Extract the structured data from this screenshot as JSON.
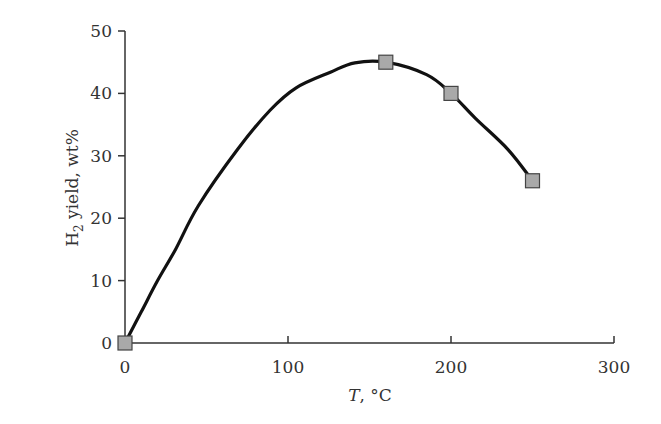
{
  "chart_data": {
    "type": "line",
    "title": "",
    "xlabel": "T, °C",
    "xlabel_italic_part": "T",
    "xlabel_rest": ", °C",
    "ylabel": "H2 yield, wt%",
    "ylabel_main": "H",
    "ylabel_sub": "2",
    "ylabel_rest": " yield, wt%",
    "xlim": [
      0,
      300
    ],
    "ylim": [
      0,
      50
    ],
    "xticks": [
      0,
      100,
      200,
      300
    ],
    "yticks": [
      0,
      10,
      20,
      30,
      40,
      50
    ],
    "grid": false,
    "legend": null,
    "series": [
      {
        "name": "H2 yield (measured)",
        "style": "markers",
        "marker": "square",
        "marker_fill": "#a9a9a9",
        "marker_edge": "#444444",
        "x": [
          0,
          160,
          200,
          250
        ],
        "y": [
          0,
          45,
          40,
          26
        ]
      },
      {
        "name": "H2 yield (fitted curve)",
        "style": "line",
        "color": "#111111",
        "x": [
          0,
          10,
          20,
          31,
          45,
          69,
          89,
          105,
          126,
          141,
          160,
          185,
          200,
          215,
          235,
          250
        ],
        "y": [
          0,
          5,
          10,
          15,
          22,
          31,
          37.3,
          40.9,
          43.4,
          44.9,
          45,
          43,
          40,
          36,
          31,
          26
        ]
      }
    ]
  },
  "colors": {
    "axis": "#333333",
    "curve": "#111111",
    "marker_fill": "#a9a9a9",
    "marker_edge": "#444444"
  }
}
